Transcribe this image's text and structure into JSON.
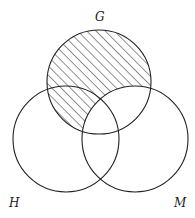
{
  "diagram": {
    "type": "venn",
    "sets": [
      {
        "id": "G",
        "label": "G",
        "cx": 99,
        "cy": 82,
        "r": 52,
        "label_x": 95,
        "label_y": 21
      },
      {
        "id": "H",
        "label": "H",
        "cx": 66,
        "cy": 139,
        "r": 53,
        "label_x": 9,
        "label_y": 207
      },
      {
        "id": "M",
        "label": "M",
        "cx": 135,
        "cy": 139,
        "r": 53,
        "label_x": 174,
        "label_y": 207
      }
    ],
    "shaded_region": "G − M",
    "shading": {
      "style": "diagonal-hatch",
      "spacing": 6.5,
      "angle": 45,
      "color": "#222222"
    },
    "stroke_color": "#222222"
  }
}
